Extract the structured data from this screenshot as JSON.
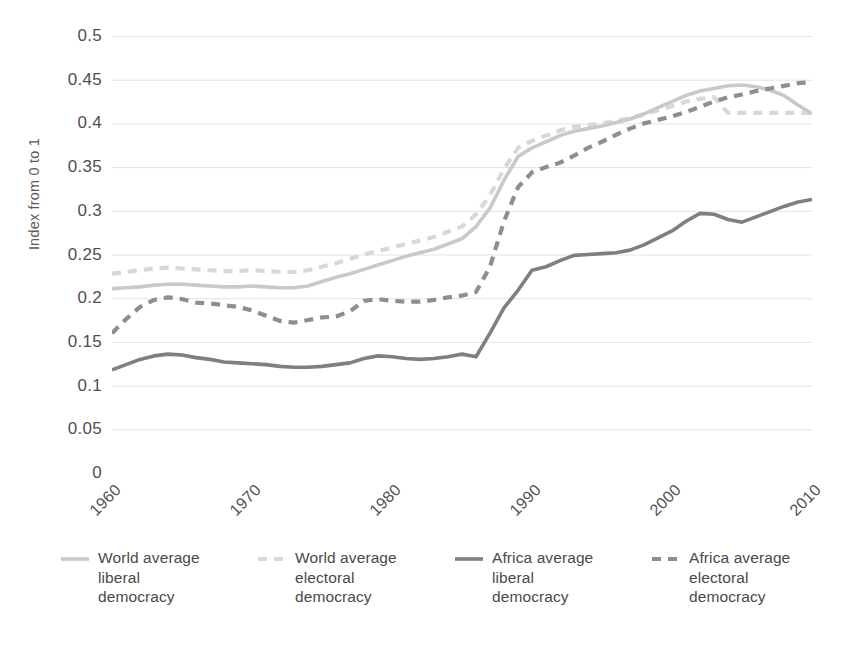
{
  "chart_data": {
    "type": "line",
    "title": "",
    "subtitle": "",
    "xlabel": "",
    "ylabel": "Index from 0 to 1",
    "xlim": [
      1960,
      2010
    ],
    "ylim": [
      0,
      0.5
    ],
    "grid": true,
    "legend_position": "bottom",
    "x_tick_labels": [
      "1960",
      "1970",
      "1980",
      "1990",
      "2000",
      "2010"
    ],
    "x_tick_values": [
      1960,
      1970,
      1980,
      1990,
      2000,
      2010
    ],
    "y_tick_labels": [
      "0",
      "0.05",
      "0.1",
      "0.15",
      "0.2",
      "0.25",
      "0.3",
      "0.35",
      "0.4",
      "0.45",
      "0.5"
    ],
    "y_tick_values": [
      0,
      0.05,
      0.1,
      0.15,
      0.2,
      0.25,
      0.3,
      0.35,
      0.4,
      0.45,
      0.5
    ],
    "x": [
      1960,
      1961,
      1962,
      1963,
      1964,
      1965,
      1966,
      1967,
      1968,
      1969,
      1970,
      1971,
      1972,
      1973,
      1974,
      1975,
      1976,
      1977,
      1978,
      1979,
      1980,
      1981,
      1982,
      1983,
      1984,
      1985,
      1986,
      1987,
      1988,
      1989,
      1990,
      1991,
      1992,
      1993,
      1994,
      1995,
      1996,
      1997,
      1998,
      1999,
      2000,
      2001,
      2002,
      2003,
      2004,
      2005,
      2006,
      2007,
      2008,
      2009,
      2010
    ],
    "series": [
      {
        "name": "World average liberal democracy",
        "style": "solid",
        "color": "#c9c9c9",
        "values": [
          0.211,
          0.212,
          0.213,
          0.215,
          0.216,
          0.216,
          0.215,
          0.214,
          0.213,
          0.213,
          0.214,
          0.213,
          0.212,
          0.212,
          0.214,
          0.219,
          0.224,
          0.228,
          0.233,
          0.238,
          0.243,
          0.248,
          0.252,
          0.256,
          0.262,
          0.268,
          0.282,
          0.303,
          0.335,
          0.362,
          0.372,
          0.379,
          0.386,
          0.391,
          0.394,
          0.397,
          0.401,
          0.405,
          0.411,
          0.418,
          0.425,
          0.432,
          0.437,
          0.44,
          0.443,
          0.444,
          0.442,
          0.438,
          0.432,
          0.421,
          0.411
        ]
      },
      {
        "name": "World average electoral democracy",
        "style": "dashed",
        "color": "#d8d8d8",
        "values": [
          0.228,
          0.23,
          0.232,
          0.234,
          0.235,
          0.234,
          0.233,
          0.232,
          0.231,
          0.231,
          0.232,
          0.231,
          0.23,
          0.23,
          0.232,
          0.236,
          0.24,
          0.245,
          0.25,
          0.254,
          0.258,
          0.262,
          0.266,
          0.27,
          0.276,
          0.282,
          0.296,
          0.318,
          0.348,
          0.372,
          0.38,
          0.386,
          0.392,
          0.396,
          0.398,
          0.4,
          0.403,
          0.406,
          0.41,
          0.415,
          0.42,
          0.425,
          0.428,
          0.43,
          0.412,
          0.412,
          0.412,
          0.412,
          0.412,
          0.412,
          0.412
        ]
      },
      {
        "name": "Africa average liberal democracy",
        "style": "solid",
        "color": "#7f7f7f",
        "values": [
          0.118,
          0.124,
          0.13,
          0.134,
          0.136,
          0.135,
          0.132,
          0.13,
          0.127,
          0.126,
          0.125,
          0.124,
          0.122,
          0.121,
          0.121,
          0.122,
          0.124,
          0.126,
          0.131,
          0.134,
          0.133,
          0.131,
          0.13,
          0.131,
          0.133,
          0.136,
          0.133,
          0.16,
          0.189,
          0.209,
          0.232,
          0.236,
          0.243,
          0.249,
          0.25,
          0.251,
          0.252,
          0.255,
          0.261,
          0.269,
          0.277,
          0.288,
          0.297,
          0.296,
          0.29,
          0.287,
          0.293,
          0.299,
          0.305,
          0.31,
          0.313
        ]
      },
      {
        "name": "Africa average electoral democracy",
        "style": "dashed",
        "color": "#8e8e8e",
        "values": [
          0.16,
          0.176,
          0.19,
          0.198,
          0.201,
          0.199,
          0.195,
          0.194,
          0.192,
          0.19,
          0.186,
          0.18,
          0.174,
          0.172,
          0.175,
          0.178,
          0.179,
          0.185,
          0.197,
          0.199,
          0.197,
          0.196,
          0.196,
          0.198,
          0.201,
          0.203,
          0.207,
          0.236,
          0.288,
          0.327,
          0.344,
          0.35,
          0.355,
          0.363,
          0.372,
          0.379,
          0.387,
          0.394,
          0.4,
          0.404,
          0.408,
          0.413,
          0.419,
          0.425,
          0.43,
          0.433,
          0.437,
          0.44,
          0.443,
          0.446,
          0.447
        ]
      }
    ]
  },
  "legend": {
    "items": [
      {
        "label_line1": "World average",
        "label_line2": "liberal",
        "label_line3": "democracy",
        "swatch": "solid-line-swatch",
        "color": "#c9c9c9",
        "style": "solid"
      },
      {
        "label_line1": "World average",
        "label_line2": "electoral",
        "label_line3": "democracy",
        "swatch": "dashed-line-swatch",
        "color": "#d8d8d8",
        "style": "dashed"
      },
      {
        "label_line1": "Africa average",
        "label_line2": "liberal",
        "label_line3": "democracy",
        "swatch": "solid-line-swatch",
        "color": "#7f7f7f",
        "style": "solid"
      },
      {
        "label_line1": "Africa average",
        "label_line2": "electoral",
        "label_line3": "democracy",
        "swatch": "dashed-line-swatch",
        "color": "#8e8e8e",
        "style": "dashed"
      }
    ]
  },
  "axes": {
    "y_title": "Index from 0 to 1"
  },
  "colors": {
    "background": "#ffffff",
    "grid": "#e3e3e3",
    "axis_line": "#d4d4d4",
    "text": "#4a4a4a"
  }
}
